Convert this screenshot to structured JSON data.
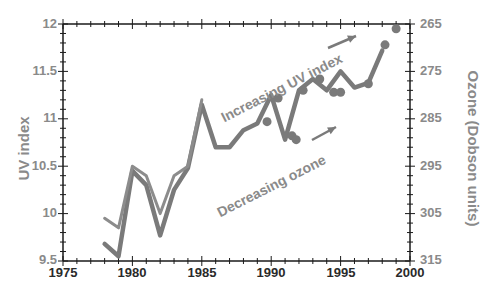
{
  "chart_data": {
    "type": "line",
    "title": "",
    "xlabel": "",
    "ylabel": "UV index",
    "ylabel_right": "Ozone (Dobson units)",
    "xlim": [
      1975,
      2000
    ],
    "ylim": [
      9.5,
      12
    ],
    "ylim_right": [
      315,
      265
    ],
    "x_ticks": [
      "1975",
      "1980",
      "1985",
      "1990",
      "1995",
      "2000"
    ],
    "y_ticks": [
      "9.5",
      "10",
      "10.5",
      "11",
      "11.5",
      "12"
    ],
    "y_ticks_right": [
      "315",
      "305",
      "295",
      "285",
      "275",
      "265"
    ],
    "grid": false,
    "legend": null,
    "annotations": [
      "Increasing UV index",
      "Decreasing ozone"
    ],
    "series": [
      {
        "name": "UV index (light line)",
        "x": [
          1978,
          1979,
          1980,
          1981,
          1982,
          1983,
          1984,
          1985
        ],
        "values": [
          9.95,
          9.85,
          10.5,
          10.4,
          10.0,
          10.4,
          10.5,
          11.2
        ]
      },
      {
        "name": "Ozone (inverted, thick line)",
        "x": [
          1978,
          1979,
          1980,
          1981,
          1982,
          1983,
          1984,
          1985,
          1986,
          1987,
          1988,
          1989,
          1990,
          1991,
          1992,
          1993,
          1994,
          1995,
          1996,
          1997,
          1998
        ],
        "values": [
          9.68,
          9.55,
          10.45,
          10.3,
          9.77,
          10.25,
          10.48,
          11.15,
          10.7,
          10.7,
          10.88,
          10.95,
          11.25,
          10.78,
          11.3,
          11.42,
          11.3,
          11.5,
          11.33,
          11.38,
          11.72
        ]
      },
      {
        "name": "UV index measurements (dots)",
        "x": [
          1989.7,
          1990.5,
          1991.5,
          1991.8,
          1992.3,
          1993.5,
          1994.5,
          1995.0,
          1997.0,
          1998.2,
          1999.0
        ],
        "values": [
          10.97,
          11.22,
          10.82,
          10.78,
          11.3,
          11.42,
          11.28,
          11.28,
          11.37,
          11.78,
          11.95
        ]
      }
    ]
  },
  "labels": {
    "ylabel": "UV index",
    "ylabel_right": "Ozone (Dobson units)",
    "annotation_uv": "Increasing UV index",
    "annotation_ozone": "Decreasing ozone",
    "y_ticks": [
      "12",
      "11.5",
      "11",
      "10.5",
      "10",
      "9.5"
    ],
    "y_ticks_right": [
      "265",
      "275",
      "285",
      "295",
      "305",
      "315"
    ],
    "x_ticks": [
      "1975",
      "1980",
      "1985",
      "1990",
      "1995",
      "2000"
    ]
  },
  "colors": {
    "axis": "#1a1a1a",
    "line": "#7a7a7a",
    "label": "#8a8a8a"
  }
}
